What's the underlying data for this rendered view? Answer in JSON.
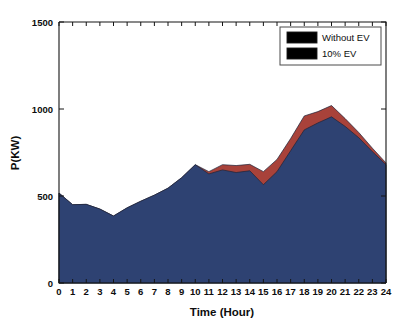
{
  "figure": {
    "background": "#ffffff",
    "plot_background": "#ffffff"
  },
  "axes": {
    "x_title": "Time (Hour)",
    "y_title": "P(KW)",
    "x_ticklabels": [
      "0",
      "1",
      "2",
      "3",
      "4",
      "5",
      "6",
      "7",
      "8",
      "9",
      "10",
      "11",
      "12",
      "13",
      "14",
      "15",
      "16",
      "17",
      "18",
      "19",
      "20",
      "21",
      "22",
      "23",
      "24"
    ],
    "y_ticklabels": [
      "0",
      "500",
      "1000",
      "1500"
    ]
  },
  "legend": {
    "position": "top-right",
    "items": [
      {
        "label": "Without EV",
        "color": "#2e4272"
      },
      {
        "label": "10% EV",
        "color": "#a8423a"
      }
    ]
  },
  "chart_data": {
    "type": "area",
    "title": "",
    "xlabel": "Time (Hour)",
    "ylabel": "P(KW)",
    "xlim": [
      0,
      24
    ],
    "ylim": [
      0,
      1500
    ],
    "xticks": [
      0,
      1,
      2,
      3,
      4,
      5,
      6,
      7,
      8,
      9,
      10,
      11,
      12,
      13,
      14,
      15,
      16,
      17,
      18,
      19,
      20,
      21,
      22,
      23,
      24
    ],
    "yticks": [
      0,
      500,
      1000,
      1500
    ],
    "grid": false,
    "legend_position": "upper right",
    "stacked": true,
    "x": [
      0,
      1,
      2,
      3,
      4,
      5,
      6,
      7,
      8,
      9,
      10,
      11,
      12,
      13,
      14,
      15,
      16,
      17,
      18,
      19,
      20,
      21,
      22,
      23,
      24
    ],
    "series": [
      {
        "name": "Without EV",
        "color": "#2e4272",
        "values": [
          517,
          450,
          452,
          425,
          385,
          432,
          470,
          505,
          545,
          605,
          680,
          627,
          650,
          635,
          645,
          565,
          640,
          760,
          880,
          920,
          955,
          900,
          835,
          755,
          680
        ]
      },
      {
        "name": "10% EV",
        "color": "#a8423a",
        "values": [
          517,
          450,
          452,
          425,
          385,
          432,
          470,
          505,
          545,
          605,
          680,
          640,
          680,
          675,
          682,
          640,
          710,
          830,
          960,
          985,
          1020,
          945,
          865,
          775,
          690
        ]
      }
    ]
  }
}
